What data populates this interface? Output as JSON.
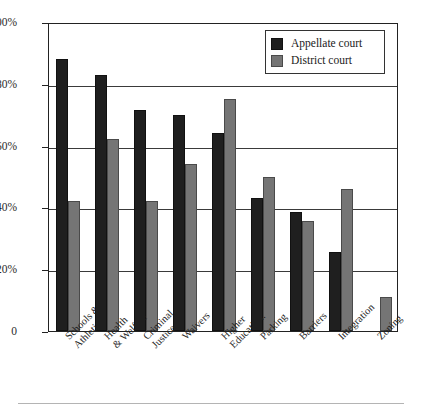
{
  "chart_data": {
    "type": "bar",
    "title": "",
    "xlabel": "",
    "ylabel": "",
    "ylim": [
      0,
      100
    ],
    "yticks": [
      0,
      20,
      40,
      60,
      80,
      100
    ],
    "ytick_labels": [
      "0",
      "20%",
      "40%",
      "60%",
      "80%",
      "100%"
    ],
    "grid": true,
    "legend_position": "top-right inside axes",
    "categories": [
      "Schools & Athletic",
      "Health & Welfare",
      "Criminal Justice",
      "Waivers",
      "Higher Education.",
      "Parking",
      "Barriers",
      "Integration",
      "Zoning"
    ],
    "category_lines": [
      [
        "Schools &",
        "Athletic"
      ],
      [
        "Health",
        "& Welfare"
      ],
      [
        "Criminal",
        "Justice"
      ],
      [
        "Waivers"
      ],
      [
        "Higher",
        "Education."
      ],
      [
        "Parking"
      ],
      [
        "Barriers"
      ],
      [
        "Integration"
      ],
      [
        "Zoning"
      ]
    ],
    "series": [
      {
        "name": "Appellate court",
        "color": "#1f1f1f",
        "values": [
          88,
          83,
          71.5,
          70,
          64,
          43,
          38.5,
          25.5,
          0
        ]
      },
      {
        "name": "District court",
        "color": "#757575",
        "values": [
          42,
          62,
          42,
          54,
          75,
          50,
          35.5,
          46,
          11
        ]
      }
    ]
  },
  "legend": {
    "items": [
      {
        "label": "Appellate court",
        "swatch": "appellate"
      },
      {
        "label": "District court",
        "swatch": "district"
      }
    ]
  },
  "colors": {
    "appellate": "#1f1f1f",
    "district": "#757575",
    "axis": "#222222",
    "grid": "#3a3a3a",
    "background": "#ffffff"
  }
}
